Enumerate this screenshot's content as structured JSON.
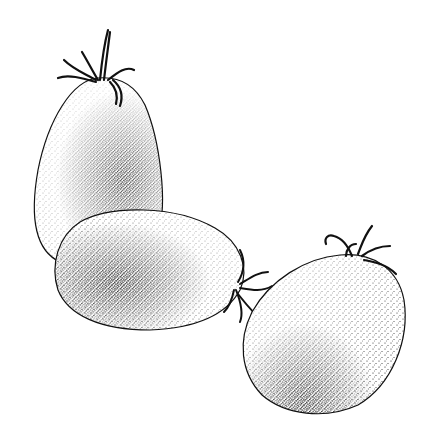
{
  "illustration": {
    "subject": "Three plum (Roma) tomatoes",
    "style": "Stippled pen-and-ink drawing",
    "background_color": "#ffffff",
    "ink_color": "#111111",
    "items": [
      {
        "name": "upright-tomato",
        "label": "Upright tomato with calyx on top",
        "position": "top-left"
      },
      {
        "name": "lying-tomato",
        "label": "Horizontal tomato with calyx at right end",
        "position": "center-left"
      },
      {
        "name": "tilted-tomato",
        "label": "Tilted tomato with calyx at upper right",
        "position": "bottom-right"
      }
    ]
  }
}
